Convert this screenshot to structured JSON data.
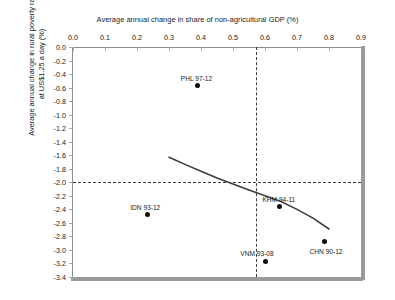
{
  "chart_data": {
    "type": "scatter",
    "title": "Average annual change in share of non-agricultural GDP (%)",
    "xlabel": "Average annual change in share of non-agricultural GDP (%)",
    "ylabel_line1": "Average annual change in rural poverty rate",
    "ylabel_line2": "at US$1.25 a day (%)",
    "xlim": [
      0.0,
      0.9
    ],
    "ylim": [
      -3.4,
      0.0
    ],
    "xticks": [
      "0.0",
      "0.1",
      "0.2",
      "0.3",
      "0.4",
      "0.5",
      "0.6",
      "0.7",
      "0.8",
      "0.9"
    ],
    "xtick_values": [
      0.0,
      0.1,
      0.2,
      0.3,
      0.4,
      0.5,
      0.6,
      0.7,
      0.8,
      0.9
    ],
    "yticks": [
      "0.0",
      "-0.2",
      "-0.4",
      "-0.6",
      "-0.8",
      "-1.0",
      "-1.2",
      "-1.4",
      "-1.6",
      "-1.8",
      "-2.0",
      "-2.2",
      "-2.4",
      "-2.6",
      "-2.8",
      "-3.0",
      "-3.2",
      "-3.4"
    ],
    "ytick_values": [
      0.0,
      -0.2,
      -0.4,
      -0.6,
      -0.8,
      -1.0,
      -1.2,
      -1.4,
      -1.6,
      -1.8,
      -2.0,
      -2.2,
      -2.4,
      -2.6,
      -2.8,
      -3.0,
      -3.2,
      -3.4
    ],
    "grid": false,
    "legend": "none",
    "axis_title_position": "top",
    "points": [
      {
        "label": "PHL 97-12",
        "x": 0.39,
        "y": -0.57,
        "label_dx": -17,
        "label_dy": -11
      },
      {
        "label": "IDN 93-12",
        "x": 0.232,
        "y": -2.48,
        "label_dx": -17,
        "label_dy": -11
      },
      {
        "label": "KHM 94-11",
        "x": 0.645,
        "y": -2.36,
        "label_dx": -17,
        "label_dy": -11
      },
      {
        "label": "VNM 93-08",
        "x": 0.601,
        "y": -3.17,
        "label_dx": -25,
        "label_dy": -11
      },
      {
        "label": "CHN 90-12",
        "x": 0.786,
        "y": -2.88,
        "label_dx": -15,
        "label_dy": 6
      }
    ],
    "reference_lines": {
      "horizontal_y": -2.0,
      "vertical_x": 0.572,
      "style": "dashed",
      "color": "#3d3d3d"
    },
    "trend_curve": {
      "name": "fitted trend",
      "color": "#3d3d3d",
      "x_start": 0.3,
      "x_end": 0.8,
      "points": [
        {
          "x": 0.3,
          "y": -1.63
        },
        {
          "x": 0.35,
          "y": -1.735
        },
        {
          "x": 0.4,
          "y": -1.838
        },
        {
          "x": 0.45,
          "y": -1.935
        },
        {
          "x": 0.5,
          "y": -2.027
        },
        {
          "x": 0.55,
          "y": -2.115
        },
        {
          "x": 0.6,
          "y": -2.2
        },
        {
          "x": 0.65,
          "y": -2.285
        },
        {
          "x": 0.7,
          "y": -2.4
        },
        {
          "x": 0.75,
          "y": -2.53
        },
        {
          "x": 0.8,
          "y": -2.69
        }
      ]
    }
  }
}
